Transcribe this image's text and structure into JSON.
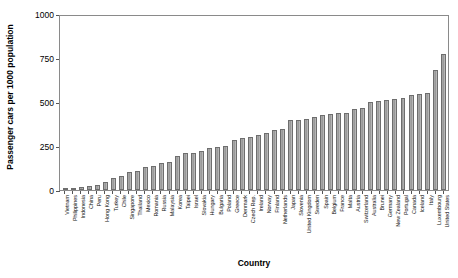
{
  "chart_data": {
    "type": "bar",
    "title": "",
    "xlabel": "Country",
    "ylabel": "Passenger cars per 1000 population",
    "ylim": [
      0,
      1000
    ],
    "yticks": [
      0,
      250,
      500,
      750,
      1000
    ],
    "grid": false,
    "legend": null,
    "bar_color": "#a0a0a0",
    "bar_edge_color": "#6e6e6e",
    "categories": [
      "Vietnam",
      "Philippines",
      "Indonesia",
      "China",
      "Peru",
      "Hong Kong",
      "Turkey",
      "Chile",
      "Singapore",
      "Thailand",
      "Mexico",
      "Romania",
      "Russia",
      "Malaysia",
      "Korea",
      "Taipei",
      "Israel",
      "Slovakia",
      "Hungary",
      "Bulgaria",
      "Poland",
      "Greece",
      "Denmark",
      "Czech Rep.",
      "Ireland",
      "Norway",
      "Finland",
      "Netherlands",
      "Japan",
      "Slovenia",
      "United Kingdom",
      "Sweden",
      "Spain",
      "Belgium",
      "France",
      "Malta",
      "Austria",
      "Switzerland",
      "Australia",
      "Brunei",
      "Germany",
      "New Zealand",
      "Portugal",
      "Canada",
      "Iceland",
      "Italy",
      "Luxembourg",
      "United States"
    ],
    "values": [
      8,
      12,
      20,
      24,
      30,
      45,
      70,
      80,
      105,
      110,
      130,
      140,
      155,
      160,
      195,
      210,
      215,
      225,
      240,
      250,
      255,
      290,
      300,
      305,
      315,
      330,
      345,
      350,
      400,
      405,
      410,
      420,
      430,
      435,
      440,
      445,
      465,
      470,
      505,
      510,
      520,
      525,
      530,
      545,
      550,
      560,
      690,
      780
    ]
  }
}
